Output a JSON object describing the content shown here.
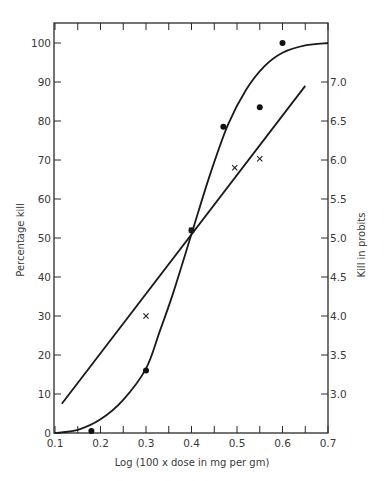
{
  "chart_data": {
    "type": "scatter",
    "title": "",
    "xlabel": "Log (100 x dose in mg per gm)",
    "ylabel": "Percentage kill",
    "y2label": "Kill in probits",
    "xlim": [
      0.1,
      0.7
    ],
    "ylim": [
      0,
      100
    ],
    "x_ticks": [
      0.1,
      0.2,
      0.3,
      0.4,
      0.5,
      0.6,
      0.7
    ],
    "x_tick_labels": [
      "0.1",
      "0.2",
      "0.3",
      "0.4",
      "0.5",
      "0.6",
      "0.7"
    ],
    "x_minor_step": 0.05,
    "y_ticks": [
      0,
      10,
      20,
      30,
      40,
      50,
      60,
      70,
      80,
      90,
      100
    ],
    "y_tick_labels": [
      "0",
      "10",
      "20",
      "30",
      "40",
      "50",
      "60",
      "70",
      "80",
      "90",
      "100"
    ],
    "y2_ticks": [
      {
        "label": "3.0",
        "pos": 10
      },
      {
        "label": "3.5",
        "pos": 20
      },
      {
        "label": "4.0",
        "pos": 30
      },
      {
        "label": "4.5",
        "pos": 40
      },
      {
        "label": "5.0",
        "pos": 50
      },
      {
        "label": "5.5",
        "pos": 60
      },
      {
        "label": "6.0",
        "pos": 70
      },
      {
        "label": "6.5",
        "pos": 80
      },
      {
        "label": "7.0",
        "pos": 90
      }
    ],
    "grid": false,
    "legend": null,
    "series": [
      {
        "name": "Percentage kill (observed)",
        "marker": "dot",
        "points": [
          {
            "x": 0.18,
            "y": 0.5
          },
          {
            "x": 0.3,
            "y": 16
          },
          {
            "x": 0.4,
            "y": 52
          },
          {
            "x": 0.47,
            "y": 78.5
          },
          {
            "x": 0.55,
            "y": 83.5
          },
          {
            "x": 0.6,
            "y": 100
          }
        ]
      },
      {
        "name": "Kill in probits (observed)",
        "marker": "cross",
        "points": [
          {
            "x": 0.3,
            "y": 30
          },
          {
            "x": 0.4,
            "y": 52
          },
          {
            "x": 0.495,
            "y": 68
          },
          {
            "x": 0.55,
            "y": 70.3
          }
        ]
      },
      {
        "name": "Sigmoid fit (percentage)",
        "type": "line",
        "points": [
          {
            "x": 0.1,
            "y": 0
          },
          {
            "x": 0.15,
            "y": 0.8
          },
          {
            "x": 0.2,
            "y": 3.5
          },
          {
            "x": 0.25,
            "y": 8.5
          },
          {
            "x": 0.3,
            "y": 16.5
          },
          {
            "x": 0.33,
            "y": 26
          },
          {
            "x": 0.36,
            "y": 36
          },
          {
            "x": 0.4,
            "y": 51
          },
          {
            "x": 0.44,
            "y": 66
          },
          {
            "x": 0.48,
            "y": 79
          },
          {
            "x": 0.52,
            "y": 88
          },
          {
            "x": 0.56,
            "y": 94
          },
          {
            "x": 0.6,
            "y": 97.5
          },
          {
            "x": 0.65,
            "y": 99.4
          },
          {
            "x": 0.7,
            "y": 100
          }
        ]
      },
      {
        "name": "Linear fit (probits)",
        "type": "line",
        "points": [
          {
            "x": 0.115,
            "y": 7.5
          },
          {
            "x": 0.65,
            "y": 89
          }
        ]
      }
    ]
  }
}
